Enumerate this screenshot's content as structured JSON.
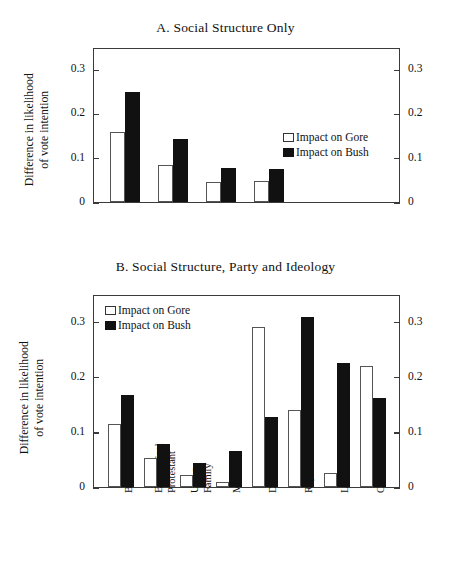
{
  "figure": {
    "axis_title_line1": "Difference  in likelihood",
    "axis_title_line2": "of vote intention",
    "legend": {
      "gore": "Impact on Gore",
      "bush": "Impact on Bush"
    },
    "tick_labels": [
      "0.3",
      "0.2",
      "0.1",
      "0"
    ]
  },
  "chart_data": [
    {
      "type": "bar",
      "panel": "A",
      "title": "A. Social Structure Only",
      "xlabel": "",
      "ylabel": "Difference in likelihood of vote intention",
      "ylim": [
        0,
        0.35
      ],
      "yticks": [
        0,
        0.1,
        0.2,
        0.3
      ],
      "grid": false,
      "legend_position": "right",
      "categories": [
        "Black",
        "Evangelical Protestant",
        "Union Family",
        "Male"
      ],
      "series": [
        {
          "name": "Impact on Gore",
          "values": [
            0.157,
            0.083,
            0.045,
            0.047
          ]
        },
        {
          "name": "Impact on Bush",
          "values": [
            0.248,
            0.142,
            0.077,
            0.075
          ]
        }
      ]
    },
    {
      "type": "bar",
      "panel": "B",
      "title": "B. Social Structure, Party and Ideology",
      "xlabel": "",
      "ylabel": "Difference in likelihood of vote intention",
      "ylim": [
        0,
        0.35
      ],
      "yticks": [
        0,
        0.1,
        0.2,
        0.3
      ],
      "grid": false,
      "legend_position": "top-left",
      "categories": [
        "Black",
        "Evangelical Protestant",
        "Union Family",
        "Male",
        "Democrat",
        "Republican",
        "Liberal",
        "Conservative"
      ],
      "series": [
        {
          "name": "Impact on Gore",
          "values": [
            0.115,
            0.053,
            0.021,
            0.01,
            0.29,
            0.139,
            0.026,
            0.219
          ]
        },
        {
          "name": "Impact on Bush",
          "values": [
            0.166,
            0.078,
            0.043,
            0.066,
            0.127,
            0.308,
            0.224,
            0.161
          ]
        }
      ]
    }
  ],
  "panelA": {
    "title": "A. Social Structure Only",
    "bars": [
      {
        "group": "Black",
        "gore": 0.157,
        "bush": 0.248
      },
      {
        "group": "Evangelical Protestant",
        "gore": 0.083,
        "bush": 0.142
      },
      {
        "group": "Union Family",
        "gore": 0.045,
        "bush": 0.077
      },
      {
        "group": "Male",
        "gore": 0.047,
        "bush": 0.075
      }
    ]
  },
  "panelB": {
    "title": "B. Social Structure, Party and Ideology",
    "categories": [
      {
        "line1": "Black",
        "line2": ""
      },
      {
        "line1": "Evangelical",
        "line2": "Protestant"
      },
      {
        "line1": "Union",
        "line2": "Family"
      },
      {
        "line1": "Male",
        "line2": ""
      },
      {
        "line1": "Democrat",
        "line2": ""
      },
      {
        "line1": "Republican",
        "line2": ""
      },
      {
        "line1": "Liberal",
        "line2": ""
      },
      {
        "line1": "Conservative",
        "line2": ""
      }
    ],
    "bars": [
      {
        "group": "Black",
        "gore": 0.115,
        "bush": 0.166
      },
      {
        "group": "Evangelical Protestant",
        "gore": 0.053,
        "bush": 0.078
      },
      {
        "group": "Union Family",
        "gore": 0.021,
        "bush": 0.043
      },
      {
        "group": "Male",
        "gore": 0.01,
        "bush": 0.066
      },
      {
        "group": "Democrat",
        "gore": 0.29,
        "bush": 0.127
      },
      {
        "group": "Republican",
        "gore": 0.139,
        "bush": 0.308
      },
      {
        "group": "Liberal",
        "gore": 0.026,
        "bush": 0.224
      },
      {
        "group": "Conservative",
        "gore": 0.219,
        "bush": 0.161
      }
    ]
  }
}
